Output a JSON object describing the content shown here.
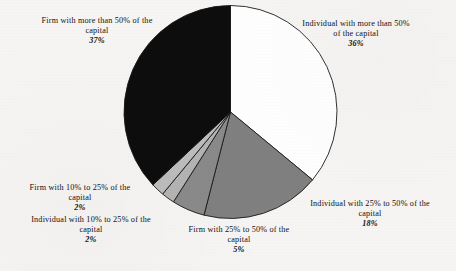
{
  "figure": {
    "name": "ownership-structure-pie-chart",
    "background_color": "#f6f5f3"
  },
  "chart_data": {
    "type": "pie",
    "title": "",
    "subtitle": "",
    "xlabel": "",
    "ylabel": "",
    "legend_position": "none",
    "grid": false,
    "units": "percent",
    "total": 100,
    "start_angle_deg": 0,
    "direction": "clockwise",
    "categories": [
      "Individual with more than 50% of the capital",
      "Individual with 25% to 50% of the capital",
      "Firm with 25% to 50% of the capital",
      "Individual with 10% to 25% of the capital",
      "Firm with 10% to 25% of the capital",
      "Firm with more than 50% of the capital"
    ],
    "values": [
      36,
      18,
      5,
      2,
      2,
      37
    ],
    "value_labels": [
      "36%",
      "18%",
      "5%",
      "2%",
      "2%",
      "37%"
    ],
    "colors": [
      "#ffffff",
      "#808080",
      "#8a8a8a",
      "#b4b4b4",
      "#bdbdbd",
      "#0d0d0d"
    ],
    "slice_outline_color": "#1a1a1a",
    "slices": [
      {
        "id": "individual-gt-50",
        "label": "Individual with more than 50%",
        "label_line_1": "Individual with more than 50%",
        "label_line_2": "of the capital",
        "percent_label": "36%",
        "value": 36,
        "color": "#ffffff"
      },
      {
        "id": "individual-25-50",
        "label": "Individual with 25% to 50% of the capital",
        "label_line_1": "Individual with 25% to 50% of the",
        "label_line_2": "capital",
        "percent_label": "18%",
        "value": 18,
        "color": "#808080"
      },
      {
        "id": "firm-25-50",
        "label": "Firm with 25% to 50% of the capital",
        "label_line_1": "Firm with 25% to 50% of the",
        "label_line_2": "capital",
        "percent_label": "5%",
        "value": 5,
        "color": "#8a8a8a"
      },
      {
        "id": "individual-10-25",
        "label": "Individual with 10% to 25% of the capital",
        "label_line_1": "Individual with 10% to 25% of the",
        "label_line_2": "capital",
        "percent_label": "2%",
        "value": 2,
        "color": "#b4b4b4"
      },
      {
        "id": "firm-10-25",
        "label": "Firm with 10% to 25% of the capital",
        "label_line_1": "Firm with 10% to 25% of the",
        "label_line_2": "capital",
        "percent_label": "2%",
        "value": 2,
        "color": "#bdbdbd"
      },
      {
        "id": "firm-gt-50",
        "label": "Firm with more than 50% of the capital",
        "label_line_1": "Firm with more than 50% of the",
        "label_line_2": "capital",
        "percent_label": "37%",
        "value": 37,
        "color": "#0d0d0d"
      }
    ]
  }
}
